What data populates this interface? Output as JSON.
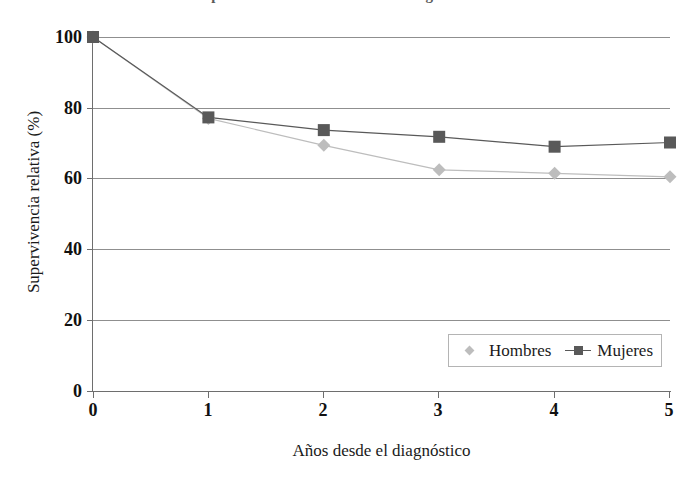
{
  "chart_data": {
    "type": "line",
    "title": "Supervivencia relativa en cáncer según el sexo",
    "xlabel": "Años desde el diagnóstico",
    "ylabel": "Supervivencia relativa (%)",
    "x": [
      0,
      1,
      2,
      3,
      4,
      5
    ],
    "xtick_labels": [
      "0",
      "1",
      "2",
      "3",
      "4",
      "5"
    ],
    "ytick_labels": [
      "0",
      "20",
      "40",
      "60",
      "80",
      "100"
    ],
    "ytick_values": [
      0,
      20,
      40,
      60,
      80,
      100
    ],
    "xlim": [
      0,
      5
    ],
    "ylim": [
      0,
      100
    ],
    "grid": "horizontal",
    "legend_position": "inside-bottom-right",
    "series": [
      {
        "name": "Hombres",
        "marker": "diamond",
        "color": "#bdbdbd",
        "values": [
          100,
          77.0,
          69.4,
          62.5,
          61.5,
          60.5
        ]
      },
      {
        "name": "Mujeres",
        "marker": "square",
        "color": "#595959",
        "values": [
          100,
          77.3,
          73.7,
          71.8,
          69.0,
          70.2
        ]
      }
    ]
  },
  "legend": {
    "items": [
      {
        "label": "Hombres",
        "marker": "diamond-marker",
        "color": "#bdbdbd"
      },
      {
        "label": "Mujeres",
        "marker": "square-marker",
        "color": "#595959"
      }
    ]
  },
  "colors": {
    "hombres": "#bdbdbd",
    "mujeres": "#595959",
    "gridline": "#8f8f8f",
    "axis": "#6e6e6e",
    "background": "#ffffff",
    "text": "#1a1a1a"
  }
}
